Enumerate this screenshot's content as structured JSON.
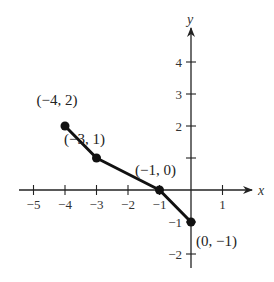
{
  "chart_data": {
    "type": "line",
    "title": "",
    "xlabel": "x",
    "ylabel": "y",
    "xlim": [
      -5.5,
      1.9
    ],
    "ylim": [
      -2.5,
      5.0
    ],
    "grid": false,
    "x_ticks": [
      -5,
      -4,
      -3,
      -2,
      -1,
      1
    ],
    "y_ticks": [
      4,
      3,
      2,
      1,
      -1,
      -2
    ],
    "x_tick_labels": [
      "−5",
      "−4",
      "−3",
      "−2",
      "−1",
      "1"
    ],
    "y_tick_labels": [
      "4",
      "3",
      "2",
      "",
      "−1",
      "−2"
    ],
    "series": [
      {
        "name": "piecewise",
        "points": [
          [
            -4,
            2
          ],
          [
            -3,
            1
          ],
          [
            -1,
            0
          ],
          [
            0,
            -1
          ]
        ],
        "labels": [
          "(−4, 2)",
          "(−3, 1)",
          "(−1, 0)",
          "(0, −1)"
        ]
      }
    ]
  }
}
